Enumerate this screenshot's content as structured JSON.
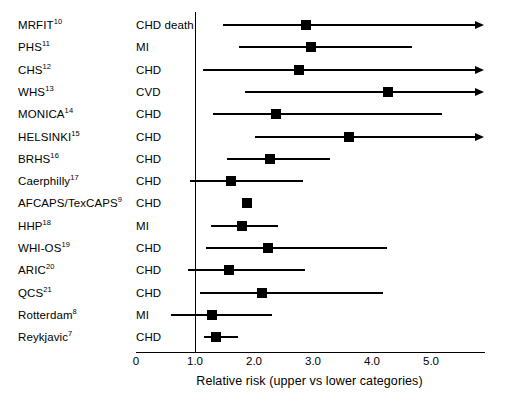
{
  "chart_data": {
    "type": "scatter",
    "subtype": "forest-plot",
    "title": "",
    "xlabel": "Relative risk (upper vs lower categories)",
    "ylabel": "",
    "xlim": [
      0,
      5.9
    ],
    "xticks": [
      0,
      1.0,
      2.0,
      3.0,
      4.0,
      5.0
    ],
    "xtick_labels": [
      "0",
      "1.0",
      "2.0",
      "3.0",
      "4.0",
      "5.0"
    ],
    "grid": false,
    "legend": null,
    "reference_line": 1.0,
    "column_headers": [
      "Study",
      "Outcome",
      "Relative risk"
    ],
    "rows": [
      {
        "study": "MRFIT",
        "ref": "10",
        "outcome": "CHD death",
        "rr": 2.88,
        "ci_low": 1.47,
        "ci_high": 5.9,
        "arrow": true
      },
      {
        "study": "PHS",
        "ref": "11",
        "outcome": "MI",
        "rr": 2.97,
        "ci_low": 1.75,
        "ci_high": 4.68,
        "arrow": false
      },
      {
        "study": "CHS",
        "ref": "12",
        "outcome": "CHD",
        "rr": 2.76,
        "ci_low": 1.14,
        "ci_high": 5.9,
        "arrow": true
      },
      {
        "study": "WHS",
        "ref": "13",
        "outcome": "CVD",
        "rr": 4.27,
        "ci_low": 1.85,
        "ci_high": 5.9,
        "arrow": true
      },
      {
        "study": "MONICA",
        "ref": "14",
        "outcome": "CHD",
        "rr": 2.37,
        "ci_low": 1.3,
        "ci_high": 5.19,
        "arrow": false
      },
      {
        "study": "HELSINKI",
        "ref": "15",
        "outcome": "CHD",
        "rr": 3.61,
        "ci_low": 2.02,
        "ci_high": 5.9,
        "arrow": true
      },
      {
        "study": "BRHS",
        "ref": "16",
        "outcome": "CHD",
        "rr": 2.27,
        "ci_low": 1.54,
        "ci_high": 3.29,
        "arrow": false
      },
      {
        "study": "Caerphilly",
        "ref": "17",
        "outcome": "CHD",
        "rr": 1.61,
        "ci_low": 0.92,
        "ci_high": 2.83,
        "arrow": false
      },
      {
        "study": "AFCAPS/TexCAPS",
        "ref": "9",
        "outcome": "CHD",
        "rr": 1.88,
        "ci_low": 1.8,
        "ci_high": 1.96,
        "arrow": false
      },
      {
        "study": "HHP",
        "ref": "18",
        "outcome": "MI",
        "rr": 1.8,
        "ci_low": 1.27,
        "ci_high": 2.41,
        "arrow": false
      },
      {
        "study": "WHI-OS",
        "ref": "19",
        "outcome": "CHD",
        "rr": 2.23,
        "ci_low": 1.19,
        "ci_high": 4.25,
        "arrow": false
      },
      {
        "study": "ARIC",
        "ref": "20",
        "outcome": "CHD",
        "rr": 1.58,
        "ci_low": 0.88,
        "ci_high": 2.86,
        "arrow": false
      },
      {
        "study": "QCS",
        "ref": "21",
        "outcome": "CHD",
        "rr": 2.14,
        "ci_low": 1.08,
        "ci_high": 4.19,
        "arrow": false
      },
      {
        "study": "Rotterdam",
        "ref": "8",
        "outcome": "MI",
        "rr": 1.28,
        "ci_low": 0.6,
        "ci_high": 2.31,
        "arrow": false
      },
      {
        "study": "Reykjavic",
        "ref": "7",
        "outcome": "CHD",
        "rr": 1.35,
        "ci_low": 1.16,
        "ci_high": 1.73,
        "arrow": false
      }
    ]
  },
  "colors": {
    "marker": "#000000",
    "line": "#000000",
    "background": "#ffffff"
  }
}
